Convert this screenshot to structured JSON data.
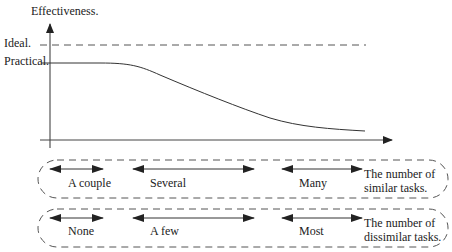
{
  "diagram": {
    "y_axis_label": "Effectiveness.",
    "levels": {
      "ideal": "Ideal.",
      "practical": "Practical."
    },
    "curve": "effectiveness decreases from practical level as number of tasks grows",
    "rows": [
      {
        "name": "similar",
        "ranges": [
          "A couple",
          "Several",
          "Many"
        ],
        "caption_line1": "The number of",
        "caption_line2": "similar tasks."
      },
      {
        "name": "dissimilar",
        "ranges": [
          "None",
          "A few",
          "Most"
        ],
        "caption_line1": "The number of",
        "caption_line2": "dissimilar tasks."
      }
    ],
    "colors": {
      "line": "#333333",
      "dash": "#555555"
    }
  }
}
